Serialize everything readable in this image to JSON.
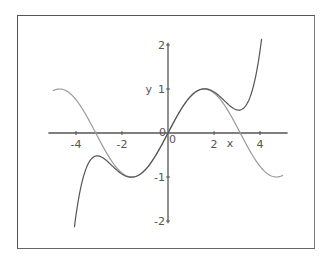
{
  "chart_data": {
    "type": "line",
    "title": "",
    "xlabel": "x",
    "ylabel": "y",
    "xlim": [
      -5,
      5
    ],
    "ylim": [
      -2,
      2
    ],
    "grid": false,
    "x_ticks": [
      "-4",
      "-2",
      "0",
      "2",
      "4"
    ],
    "y_ticks": [
      "-2",
      "-1",
      "0",
      "1",
      "2"
    ],
    "series": [
      {
        "name": "sin(x)",
        "color": "#999999",
        "x": [
          -5,
          -4,
          -3,
          -2,
          -1,
          0,
          1,
          2,
          3,
          4,
          5
        ],
        "values": [
          0.959,
          0.757,
          -0.141,
          -0.909,
          -0.841,
          0,
          0.841,
          0.909,
          0.141,
          -0.757,
          -0.959
        ]
      },
      {
        "name": "x - x^3/6 + x^5/120",
        "color": "#555555",
        "x": [
          -4.07,
          -4,
          -3,
          -2,
          -1,
          0,
          1,
          2,
          3,
          4,
          4.07
        ],
        "values": [
          -2,
          -1.867,
          -0.525,
          -0.933,
          -0.842,
          0,
          0.842,
          0.933,
          0.525,
          1.867,
          2
        ]
      }
    ]
  },
  "axes": {
    "x_label": "x",
    "y_label": "y",
    "origin_label": "0"
  }
}
